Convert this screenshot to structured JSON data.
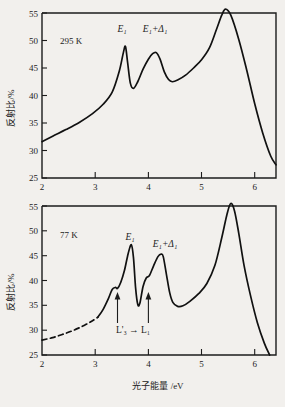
{
  "figure": {
    "background": "#f2f0ed",
    "ink": "#1c1c1c",
    "axis_titles": {
      "y": "反射比/%",
      "x": "光子能量 /eV"
    }
  },
  "chart_data": [
    {
      "type": "line",
      "title": "",
      "panel_id": "top",
      "condition_label": "295 K",
      "xlabel": "",
      "ylabel": "反射比/%",
      "xlim": [
        2,
        6.4
      ],
      "ylim": [
        25,
        55
      ],
      "xticks": [
        2,
        3,
        4,
        5,
        6
      ],
      "yticks": [
        25,
        30,
        35,
        40,
        45,
        50,
        55
      ],
      "xtick_labels": [
        "2",
        "3",
        "4",
        "5",
        "6"
      ],
      "ytick_labels": [
        "25",
        "30",
        "35",
        "40",
        "45",
        "50",
        "55"
      ],
      "grid": false,
      "legend": "none",
      "annotations": [
        {
          "text": "295 K",
          "x": 2.35,
          "y": 50.0
        },
        {
          "text": "E₁",
          "x": 3.52,
          "y": 52.2
        },
        {
          "text": "E₁+Δ₁",
          "x": 4.12,
          "y": 52.2
        }
      ],
      "series": [
        {
          "name": "reflectance-295K",
          "dashed_segment": false,
          "x": [
            2.0,
            2.2,
            2.45,
            2.7,
            2.95,
            3.15,
            3.32,
            3.45,
            3.53,
            3.57,
            3.61,
            3.66,
            3.72,
            3.8,
            3.9,
            4.0,
            4.08,
            4.15,
            4.22,
            4.3,
            4.38,
            4.45,
            4.55,
            4.7,
            4.85,
            5.0,
            5.15,
            5.28,
            5.38,
            5.45,
            5.55,
            5.7,
            5.85,
            6.0,
            6.15,
            6.3,
            6.4
          ],
          "y": [
            31.6,
            32.6,
            33.8,
            35.1,
            36.7,
            38.4,
            40.6,
            44.3,
            47.8,
            48.9,
            46.0,
            42.3,
            41.3,
            42.5,
            44.8,
            46.6,
            47.6,
            47.8,
            46.6,
            44.3,
            42.9,
            42.5,
            42.8,
            43.7,
            45.0,
            46.5,
            48.7,
            52.0,
            54.6,
            55.7,
            54.6,
            50.2,
            44.6,
            38.5,
            33.2,
            29.0,
            27.4
          ]
        }
      ]
    },
    {
      "type": "line",
      "title": "",
      "panel_id": "bottom",
      "condition_label": "77 K",
      "xlabel": "光子能量 /eV",
      "ylabel": "反射比/%",
      "xlim": [
        2,
        6.4
      ],
      "ylim": [
        25,
        55
      ],
      "xticks": [
        2,
        3,
        4,
        5,
        6
      ],
      "yticks": [
        25,
        30,
        35,
        40,
        45,
        50,
        55
      ],
      "xtick_labels": [
        "2",
        "3",
        "4",
        "5",
        "6"
      ],
      "ytick_labels": [
        "25",
        "30",
        "35",
        "40",
        "45",
        "50",
        "55"
      ],
      "grid": false,
      "legend": "none",
      "annotations": [
        {
          "text": "77 K",
          "x": 2.35,
          "y": 50.0
        },
        {
          "text": "E₁",
          "x": 3.64,
          "y": 49.8
        },
        {
          "text": "E₁+Δ₁",
          "x": 4.28,
          "y": 48.2
        },
        {
          "text": "L'₃ → L₁",
          "x": 3.72,
          "y": 28.2
        }
      ],
      "arrows": [
        {
          "x": 3.42,
          "y_from": 30.2,
          "y_to": 36.6
        },
        {
          "x": 4.0,
          "y_from": 30.2,
          "y_to": 36.6
        }
      ],
      "series": [
        {
          "name": "reflectance-77K-extrapolated",
          "dashed_segment": true,
          "x": [
            2.0,
            2.2,
            2.4,
            2.6,
            2.8,
            2.95,
            3.05
          ],
          "y": [
            28.0,
            28.5,
            29.2,
            30.0,
            31.0,
            31.9,
            32.6
          ]
        },
        {
          "name": "reflectance-77K",
          "dashed_segment": false,
          "x": [
            3.05,
            3.15,
            3.25,
            3.32,
            3.38,
            3.42,
            3.48,
            3.55,
            3.62,
            3.68,
            3.72,
            3.76,
            3.8,
            3.84,
            3.9,
            3.96,
            4.02,
            4.1,
            4.18,
            4.24,
            4.28,
            4.34,
            4.4,
            4.46,
            4.55,
            4.65,
            4.78,
            4.95,
            5.1,
            5.25,
            5.38,
            5.48,
            5.55,
            5.62,
            5.7,
            5.8,
            5.92,
            6.05,
            6.18,
            6.28
          ],
          "y": [
            32.6,
            34.2,
            36.4,
            38.2,
            38.6,
            38.4,
            39.6,
            42.0,
            45.4,
            47.2,
            44.6,
            38.5,
            35.2,
            35.4,
            38.8,
            40.5,
            41.0,
            43.0,
            44.8,
            45.3,
            44.8,
            41.2,
            37.6,
            35.6,
            34.8,
            34.9,
            35.8,
            37.4,
            39.4,
            43.0,
            48.6,
            53.4,
            55.5,
            54.0,
            49.5,
            43.0,
            37.0,
            31.5,
            27.4,
            25.0
          ]
        }
      ]
    }
  ]
}
